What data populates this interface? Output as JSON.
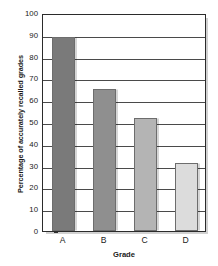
{
  "chart_data": {
    "type": "bar",
    "title": "",
    "xlabel": "Grade",
    "ylabel": "Percentage of accurately recalled grades",
    "categories": [
      "A",
      "B",
      "C",
      "D"
    ],
    "values": [
      89,
      65,
      52,
      31
    ],
    "ylim": [
      0,
      100
    ],
    "ytick_values": [
      0,
      10,
      20,
      30,
      40,
      50,
      60,
      70,
      80,
      90,
      100
    ],
    "ytick_labels": [
      "0",
      "10",
      "20",
      "30",
      "40",
      "50",
      "60",
      "70",
      "80",
      "90",
      "100"
    ],
    "grid": true,
    "legend": "none",
    "bar_colors": [
      "#7a7a7a",
      "#8f8f8f",
      "#b4b4b4",
      "#dcdcdc"
    ],
    "bar_border_color": "#6d6d6d",
    "axis_color": "#2b2b2b",
    "grid_color": "#4a4a4a"
  }
}
